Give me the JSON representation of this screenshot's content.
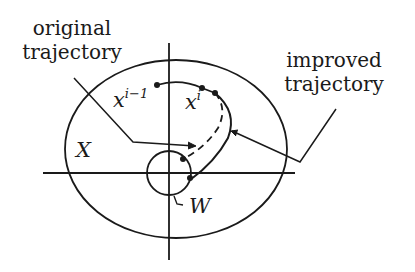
{
  "labels": {
    "original": [
      "original",
      "trajectory"
    ],
    "improved": [
      "improved",
      "trajectory"
    ],
    "set_x": "X",
    "set_w": "W",
    "point_prev": {
      "base": "x",
      "sup": "i−1"
    },
    "point_cur": {
      "base": "x",
      "sup": "i"
    }
  },
  "colors": {
    "ink": "#1a1a1a",
    "background": "#ffffff"
  }
}
